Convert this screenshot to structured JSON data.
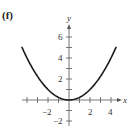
{
  "panel_label": "(f)",
  "chart_data": {
    "type": "line",
    "title": "",
    "xlabel": "x",
    "ylabel": "y",
    "function": "y = x^2 / 4",
    "xlim": [
      -4.5,
      4.5
    ],
    "ylim": [
      -3,
      7
    ],
    "x_ticks": [
      -4,
      -3,
      -2,
      -1,
      1,
      2,
      3,
      4
    ],
    "x_tick_labels": [
      "-2",
      "2",
      "4"
    ],
    "y_ticks": [
      -2,
      -1,
      1,
      2,
      3,
      4,
      5,
      6
    ],
    "y_tick_labels": [
      "-2",
      "2",
      "4",
      "6"
    ],
    "grid": false,
    "series": [
      {
        "name": "parabola",
        "x": [
          -4.5,
          -4,
          -3,
          -2,
          -1,
          0,
          1,
          2,
          3,
          4,
          4.5
        ],
        "y": [
          5.06,
          4,
          2.25,
          1,
          0.25,
          0,
          0.25,
          1,
          2.25,
          4,
          5.06
        ]
      }
    ]
  },
  "labels": {
    "x_axis": "x",
    "y_axis": "y",
    "xt_neg2": "−2",
    "xt_2": "2",
    "xt_4": "4",
    "yt_6": "6",
    "yt_4": "4",
    "yt_2": "2",
    "yt_neg2": "−2"
  }
}
